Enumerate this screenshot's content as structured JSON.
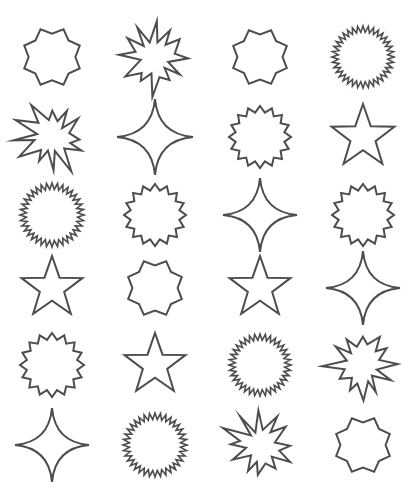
{
  "canvas": {
    "width": 419,
    "height": 501,
    "background_color": "#ffffff",
    "stroke_color": "#4d4d4d",
    "stroke_width": 2
  },
  "grid": {
    "columns": 4,
    "rows": 6,
    "column_centers": [
      52,
      155,
      260,
      363
    ],
    "row_centers": [
      57,
      137,
      215,
      288,
      365,
      445
    ]
  },
  "shape_types": {
    "octagram-blunt": {
      "label": "8-Point Blunt Star",
      "points": 8,
      "inner_ratio": 0.78,
      "style": "polygon"
    },
    "burst-irregular": {
      "label": "Irregular Explosion Burst",
      "points": 12,
      "inner_ratio": 0.45,
      "style": "irregular"
    },
    "starburst-fine": {
      "label": "Fine Starburst Sun",
      "points": 36,
      "inner_ratio": 0.8,
      "style": "polygon"
    },
    "star-16": {
      "label": "16-Point Shallow Star",
      "points": 16,
      "inner_ratio": 0.8,
      "style": "polygon"
    },
    "sparkle-4": {
      "label": "4-Point Concave Sparkle",
      "points": 4,
      "inner_ratio": 0.12,
      "style": "concave"
    },
    "star-5": {
      "label": "5-Point Classic Star",
      "points": 5,
      "inner_ratio": 0.4,
      "style": "polygon"
    }
  },
  "shapes": [
    {
      "index": 1,
      "row": 1,
      "col": 1,
      "type": "octagram-blunt",
      "cx": 52,
      "cy": 57,
      "size": 60,
      "rotation": 22.5
    },
    {
      "index": 2,
      "row": 1,
      "col": 2,
      "type": "burst-irregular",
      "cx": 155,
      "cy": 57,
      "size": 74,
      "rotation": 0
    },
    {
      "index": 3,
      "row": 1,
      "col": 3,
      "type": "octagram-blunt",
      "cx": 260,
      "cy": 57,
      "size": 58,
      "rotation": 22.5
    },
    {
      "index": 4,
      "row": 1,
      "col": 4,
      "type": "starburst-fine",
      "cx": 363,
      "cy": 57,
      "size": 62,
      "rotation": 0
    },
    {
      "index": 5,
      "row": 2,
      "col": 1,
      "type": "burst-irregular",
      "cx": 52,
      "cy": 137,
      "size": 72,
      "rotation": 0
    },
    {
      "index": 6,
      "row": 2,
      "col": 2,
      "type": "sparkle-4",
      "cx": 155,
      "cy": 137,
      "size": 76,
      "rotation": 0
    },
    {
      "index": 7,
      "row": 2,
      "col": 3,
      "type": "star-16",
      "cx": 260,
      "cy": 137,
      "size": 62,
      "rotation": 0
    },
    {
      "index": 8,
      "row": 2,
      "col": 4,
      "type": "star-5",
      "cx": 363,
      "cy": 137,
      "size": 66,
      "rotation": 0
    },
    {
      "index": 9,
      "row": 3,
      "col": 1,
      "type": "starburst-fine",
      "cx": 52,
      "cy": 215,
      "size": 64,
      "rotation": 0
    },
    {
      "index": 10,
      "row": 3,
      "col": 2,
      "type": "star-16",
      "cx": 155,
      "cy": 215,
      "size": 62,
      "rotation": 0
    },
    {
      "index": 11,
      "row": 3,
      "col": 3,
      "type": "sparkle-4",
      "cx": 260,
      "cy": 215,
      "size": 74,
      "rotation": 0
    },
    {
      "index": 12,
      "row": 3,
      "col": 4,
      "type": "star-16",
      "cx": 363,
      "cy": 215,
      "size": 62,
      "rotation": 0
    },
    {
      "index": 13,
      "row": 4,
      "col": 1,
      "type": "star-5",
      "cx": 52,
      "cy": 288,
      "size": 64,
      "rotation": 0
    },
    {
      "index": 14,
      "row": 4,
      "col": 2,
      "type": "octagram-blunt",
      "cx": 155,
      "cy": 288,
      "size": 58,
      "rotation": 22.5
    },
    {
      "index": 15,
      "row": 4,
      "col": 3,
      "type": "star-5",
      "cx": 260,
      "cy": 288,
      "size": 64,
      "rotation": 0
    },
    {
      "index": 16,
      "row": 4,
      "col": 4,
      "type": "sparkle-4",
      "cx": 363,
      "cy": 288,
      "size": 74,
      "rotation": 0
    },
    {
      "index": 17,
      "row": 5,
      "col": 1,
      "type": "star-16",
      "cx": 52,
      "cy": 365,
      "size": 64,
      "rotation": 0
    },
    {
      "index": 18,
      "row": 5,
      "col": 2,
      "type": "star-5",
      "cx": 155,
      "cy": 365,
      "size": 64,
      "rotation": 0
    },
    {
      "index": 19,
      "row": 5,
      "col": 3,
      "type": "starburst-fine",
      "cx": 260,
      "cy": 365,
      "size": 62,
      "rotation": 0
    },
    {
      "index": 20,
      "row": 5,
      "col": 4,
      "type": "burst-irregular",
      "cx": 363,
      "cy": 365,
      "size": 72,
      "rotation": 0
    },
    {
      "index": 21,
      "row": 6,
      "col": 1,
      "type": "sparkle-4",
      "cx": 52,
      "cy": 445,
      "size": 74,
      "rotation": 0
    },
    {
      "index": 22,
      "row": 6,
      "col": 2,
      "type": "starburst-fine",
      "cx": 155,
      "cy": 445,
      "size": 64,
      "rotation": 0
    },
    {
      "index": 23,
      "row": 6,
      "col": 3,
      "type": "burst-irregular",
      "cx": 260,
      "cy": 445,
      "size": 72,
      "rotation": 0
    },
    {
      "index": 24,
      "row": 6,
      "col": 4,
      "type": "octagram-blunt",
      "cx": 363,
      "cy": 445,
      "size": 58,
      "rotation": 22.5
    }
  ]
}
